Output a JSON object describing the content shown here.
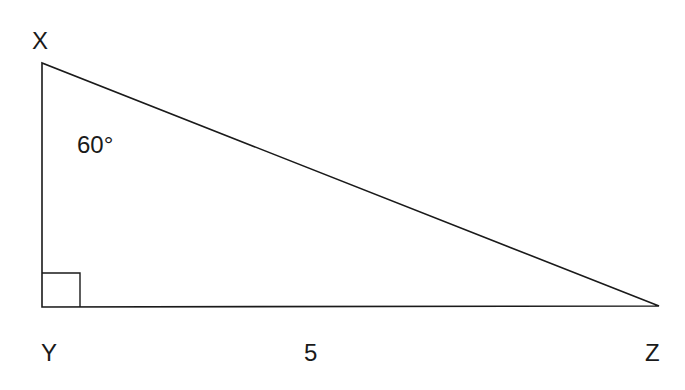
{
  "diagram": {
    "type": "right-triangle",
    "vertices": {
      "X": {
        "label": "X",
        "x": 42,
        "y": 63
      },
      "Y": {
        "label": "Y",
        "x": 42,
        "y": 307
      },
      "Z": {
        "label": "Z",
        "x": 659,
        "y": 306
      }
    },
    "angle_label": "60°",
    "side_label": "5",
    "right_angle_at": "Y",
    "stroke_color": "#1a1a1a"
  }
}
